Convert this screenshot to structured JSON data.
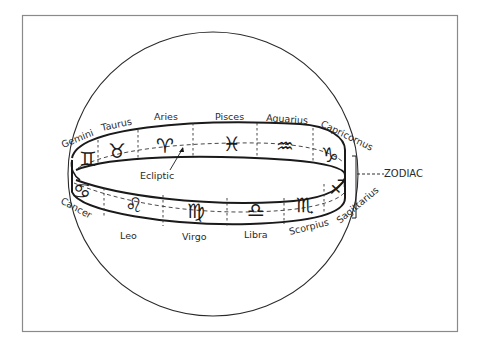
{
  "figure": {
    "band_label": "ZODIAC",
    "ecliptic_label": "Ecliptic",
    "colors": {
      "ink": "#1a1a1a",
      "frame": "#8a8a8a",
      "background": "#ffffff"
    }
  },
  "signs_top": [
    {
      "name": "Gemini",
      "glyph": "♊"
    },
    {
      "name": "Taurus",
      "glyph": "♉"
    },
    {
      "name": "Aries",
      "glyph": "♈"
    },
    {
      "name": "Pisces",
      "glyph": "♓"
    },
    {
      "name": "Aquarius",
      "glyph": "♒"
    },
    {
      "name": "Capricornus",
      "glyph": "♑"
    }
  ],
  "signs_bottom": [
    {
      "name": "Cancer",
      "glyph": "♋"
    },
    {
      "name": "Leo",
      "glyph": "♌"
    },
    {
      "name": "Virgo",
      "glyph": "♍"
    },
    {
      "name": "Libra",
      "glyph": "♎"
    },
    {
      "name": "Scorpius",
      "glyph": "♏"
    },
    {
      "name": "Sagittarius",
      "glyph": "♐"
    }
  ]
}
